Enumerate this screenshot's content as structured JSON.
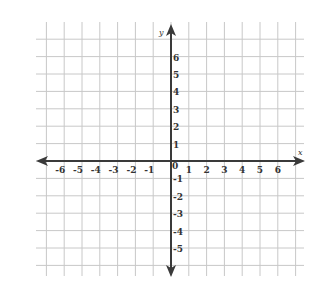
{
  "chart_data": {
    "type": "scatter",
    "title": "",
    "subtitle": "",
    "xlabel": "x",
    "ylabel": "y",
    "xlim": [
      -7,
      7
    ],
    "ylim": [
      -6,
      7
    ],
    "x_ticks": [
      -6,
      -5,
      -4,
      -3,
      -2,
      -1,
      1,
      2,
      3,
      4,
      5,
      6
    ],
    "y_ticks": [
      -5,
      -4,
      -3,
      -2,
      -1,
      1,
      2,
      3,
      4,
      5,
      6
    ],
    "origin_label": "0",
    "grid": true,
    "legend": null,
    "series": [],
    "annotations": []
  },
  "style": {
    "grid_color": "#c8c8c8",
    "axis_color": "#3a3a3a",
    "text_color": "#333333",
    "background": "#ffffff"
  }
}
